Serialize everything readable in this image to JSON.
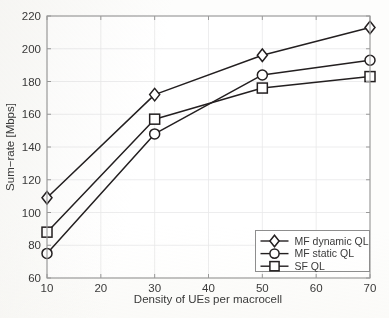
{
  "chart_data": {
    "type": "line",
    "title": "",
    "xlabel": "Density of UEs per macrocell",
    "ylabel": "Sum−rate [Mbps]",
    "x": [
      10,
      30,
      50,
      70
    ],
    "xlim": [
      10,
      70
    ],
    "ylim": [
      60,
      220
    ],
    "xticks": [
      10,
      20,
      30,
      40,
      50,
      60,
      70
    ],
    "yticks": [
      60,
      80,
      100,
      120,
      140,
      160,
      180,
      200,
      220
    ],
    "xtick_labels": [
      "10",
      "20",
      "30",
      "40",
      "50",
      "60",
      "70"
    ],
    "ytick_labels": [
      "60",
      "80",
      "100",
      "120",
      "140",
      "160",
      "180",
      "200",
      "220"
    ],
    "grid": true,
    "legend_position": "lower right",
    "series": [
      {
        "name": "MF dynamic QL",
        "marker": "diamond",
        "color": "#231f20",
        "values": [
          109,
          172,
          196,
          213
        ]
      },
      {
        "name": "MF static QL",
        "marker": "circle",
        "color": "#231f20",
        "values": [
          75,
          148,
          184,
          193
        ]
      },
      {
        "name": "SF QL",
        "marker": "square",
        "color": "#231f20",
        "values": [
          88,
          157,
          176,
          183
        ]
      }
    ]
  },
  "legend": {
    "entries": [
      {
        "label": "MF dynamic QL",
        "marker": "diamond"
      },
      {
        "label": "MF static QL",
        "marker": "circle"
      },
      {
        "label": "SF QL",
        "marker": "square"
      }
    ]
  },
  "colors": {
    "ink": "#231f20",
    "frame": "#9a9a9a",
    "grid": "#e9e9ea",
    "background": "#fdfdfc",
    "marker_fill": "#ffffff"
  }
}
